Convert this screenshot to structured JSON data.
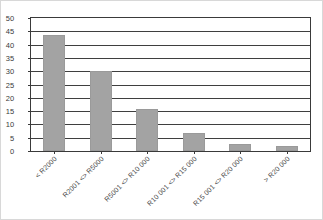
{
  "chart_data": {
    "type": "bar",
    "title": "",
    "subtitle": "",
    "xlabel": "",
    "ylabel": "",
    "ylim": [
      0,
      50
    ],
    "yticks": [
      0,
      5,
      10,
      15,
      20,
      25,
      30,
      35,
      40,
      45,
      50
    ],
    "ytick_labels": [
      "0",
      "5",
      "10",
      "15",
      "20",
      "25",
      "30",
      "35",
      "40",
      "45",
      "50"
    ],
    "grid": "horizontal",
    "legend": "none",
    "bar_color": "#a3a3a3",
    "axis_color": "#3a3a3a",
    "categories": [
      "< R2000",
      "R2001 <> R5000",
      "R5001 <> R10 000",
      "R10 001 <> R15 000",
      "R15 001 <> R20 000",
      "> R20 000"
    ],
    "values": [
      43.5,
      30,
      15.7,
      6.8,
      2.5,
      1.9
    ]
  }
}
